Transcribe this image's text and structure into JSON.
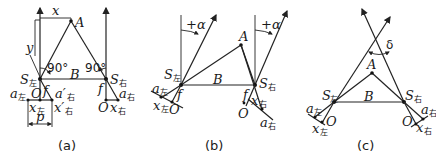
{
  "figure": {
    "panels": [
      {
        "caption": "(a)",
        "labels": {
          "x": "x",
          "y": "y",
          "A": "A",
          "B": "B",
          "S_left": "S",
          "S_left_sub": "左",
          "S_right": "S",
          "S_right_sub": "右",
          "angle_left": "90°",
          "angle_right": "90°",
          "O_left": "O",
          "O_right": "O",
          "f_left": "f",
          "f_right": "f",
          "a_left": "a",
          "a_left_sub": "左",
          "a_prime_right": "a′",
          "a_prime_right_sub": "右",
          "a_right": "a",
          "a_right_sub": "右",
          "x_left": "x",
          "x_left_sub": "左",
          "x_prime_right": "x′",
          "x_prime_right_sub": "右",
          "x_right": "x",
          "x_right_sub": "右",
          "p": "p"
        }
      },
      {
        "caption": "(b)",
        "labels": {
          "alpha_left": "+α",
          "alpha_right": "+α",
          "A": "A",
          "B": "B",
          "S_left": "S",
          "S_left_sub": "左",
          "S_right": "S",
          "S_right_sub": "右",
          "f_left": "f",
          "f_right": "f",
          "a_left": "a",
          "a_left_sub": "左",
          "x_left": "x",
          "x_left_sub": "左",
          "O_left": "O",
          "O_right": "O",
          "x_right": "x",
          "x_right_sub": "右",
          "a_right": "a",
          "a_right_sub": "右"
        }
      },
      {
        "caption": "(c)",
        "labels": {
          "delta": "δ",
          "A": "A",
          "B": "B",
          "S_left": "S",
          "S_left_sub": "左",
          "S_right": "S",
          "S_right_sub": "右",
          "a_left": "a",
          "a_left_sub": "左",
          "x_left": "x",
          "x_left_sub": "左",
          "O_left": "O",
          "O_right": "O",
          "a_right": "a",
          "a_right_sub": "右",
          "x_right": "x",
          "x_right_sub": "右"
        }
      }
    ]
  }
}
